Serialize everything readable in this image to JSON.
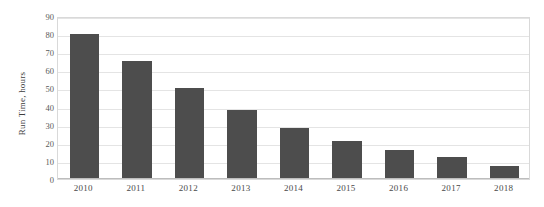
{
  "chart_data": {
    "type": "bar",
    "title": "",
    "xlabel": "",
    "ylabel": "Run Time, hours",
    "categories": [
      "2010",
      "2011",
      "2012",
      "2013",
      "2014",
      "2015",
      "2016",
      "2017",
      "2018"
    ],
    "values": [
      80,
      65,
      50,
      38,
      28,
      21,
      16,
      12,
      7
    ],
    "ylim": [
      0,
      90
    ],
    "yticks": [
      0,
      10,
      20,
      30,
      40,
      50,
      60,
      70,
      80,
      90
    ],
    "ytick_labels": [
      "0",
      "10",
      "20",
      "30",
      "40",
      "50",
      "60",
      "70",
      "80",
      "90"
    ],
    "grid": true,
    "legend": "none",
    "bar_color": "#4d4d4d",
    "grid_color": "#e4e4e4",
    "plot_border_color": "#d9d9d9",
    "background_color": "#ffffff"
  }
}
